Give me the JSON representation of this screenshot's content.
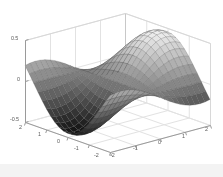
{
  "figure": {
    "kind": "matlab-3d-surface-plot",
    "background_color": "#ffffff",
    "axis_line_color": "#9a9a9a",
    "grid_color": "#e2e2e2",
    "tick_text_color": "#5a5a5a",
    "footer_band_color": "#f3f3f3"
  },
  "chart_data": {
    "type": "surface",
    "title": "",
    "xlabel": "",
    "ylabel": "",
    "zlabel": "",
    "grid": true,
    "legend": null,
    "colormap": "gray",
    "shading": "faceted",
    "projection": "3d-perspective",
    "view": {
      "azimuth": -37.5,
      "elevation": 30
    },
    "xlim": [
      -2,
      2
    ],
    "ylim": [
      -2,
      2
    ],
    "zlim": [
      -0.5,
      0.5
    ],
    "x_ticks": [
      -2,
      -1,
      0,
      1,
      2
    ],
    "x_tick_labels": [
      "-2",
      "-1",
      "0",
      "1",
      "2"
    ],
    "y_ticks": [
      -2,
      -1,
      0,
      1,
      2
    ],
    "y_tick_labels": [
      "2",
      "1",
      "0",
      "-1",
      "-2"
    ],
    "z_ticks": [
      -0.5,
      0,
      0.5
    ],
    "z_tick_labels": [
      "-0.5",
      "0",
      "0.5"
    ],
    "grid_n": 21,
    "surface_expression": "z = sin(x) * cos(y) * 0.5",
    "z_min": -0.5,
    "z_max": 0.5,
    "color_low": "#101010",
    "color_high": "#f0f0f0"
  },
  "z_axis_ticks": [
    {
      "label": "0.5",
      "x": 11,
      "y": 35
    },
    {
      "label": "0",
      "x": 17,
      "y": 76
    },
    {
      "label": "-0.5",
      "x": 10,
      "y": 116
    }
  ],
  "y_axis_ticks": [
    {
      "label": "2",
      "x": 19,
      "y": 124
    },
    {
      "label": "1",
      "x": 38,
      "y": 131
    },
    {
      "label": "0",
      "x": 57,
      "y": 138
    },
    {
      "label": "-1",
      "x": 74,
      "y": 145
    },
    {
      "label": "-2",
      "x": 94,
      "y": 152
    }
  ],
  "x_axis_ticks": [
    {
      "label": "-2",
      "x": 110,
      "y": 152
    },
    {
      "label": "-1",
      "x": 133,
      "y": 145
    },
    {
      "label": "0",
      "x": 158,
      "y": 139
    },
    {
      "label": "1",
      "x": 182,
      "y": 133
    },
    {
      "label": "2",
      "x": 205,
      "y": 126
    }
  ]
}
